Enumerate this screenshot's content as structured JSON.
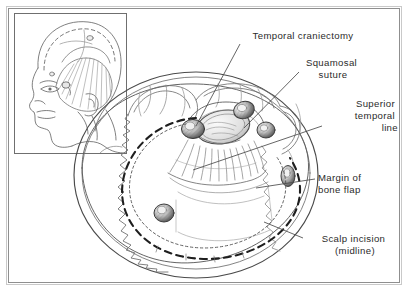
{
  "figure": {
    "title_visible": false,
    "domain": "anatomical-illustration",
    "colors": {
      "background": "#ffffff",
      "frame_border": "#a8a8a8",
      "line_art": "#3a3a3a",
      "line_art_light": "#8d8d8d",
      "text": "#2b2b2b",
      "shading": "#6e6e6e"
    },
    "frame": {
      "outer": {
        "x": 6,
        "y": 6,
        "w": 396,
        "h": 279
      },
      "inner": {
        "x": 8.5,
        "y": 8.5,
        "w": 391,
        "h": 274
      }
    },
    "inset": {
      "name": "lateral-head-orientation-inset",
      "box": {
        "x": 14,
        "y": 13,
        "w": 113,
        "h": 141
      },
      "description": "Lateral view of head showing scalp flap and temporalis muscle reflected, dashed craniotomy outline on calvarium"
    }
  },
  "labels": [
    {
      "id": "temporal-craniectomy",
      "lines": [
        "Temporal craniectomy"
      ],
      "align": "middle",
      "anchor_x": 303,
      "anchor_y": 39,
      "line_height": 12,
      "leader": {
        "x1": 240,
        "y1": 44,
        "x2": 196,
        "y2": 126
      }
    },
    {
      "id": "squamosal-suture",
      "lines": [
        "Squamosal",
        "suture"
      ],
      "align": "middle",
      "anchor_x": 333,
      "anchor_y": 66,
      "line_height": 12,
      "leader": {
        "x1": 299,
        "y1": 72,
        "x2": 244,
        "y2": 128
      }
    },
    {
      "id": "superior-temporal-line",
      "lines": [
        "Superior",
        "temporal",
        "line"
      ],
      "align": "end",
      "anchor_x": 398,
      "anchor_y": 107,
      "line_height": 12,
      "leader": {
        "x1": 322,
        "y1": 126,
        "x2": 193,
        "y2": 170
      }
    },
    {
      "id": "margin-of-bone-flap",
      "lines": [
        "Margin of",
        "bone flap"
      ],
      "align": "start",
      "anchor_x": 318,
      "anchor_y": 181,
      "line_height": 12,
      "leader": {
        "x1": 315,
        "y1": 179,
        "x2": 256,
        "y2": 188
      }
    },
    {
      "id": "scalp-incision-midline",
      "lines": [
        "Scalp incision",
        "(midline)"
      ],
      "align": "middle",
      "anchor_x": 355,
      "anchor_y": 242,
      "line_height": 12,
      "leader": {
        "x1": 303,
        "y1": 238,
        "x2": 264,
        "y2": 222
      }
    }
  ],
  "features": {
    "burr_holes": [
      {
        "id": "burr-hole-anterior-temporal",
        "cx": 193,
        "cy": 128,
        "r": 11
      },
      {
        "id": "burr-hole-frontal",
        "cx": 243,
        "cy": 110,
        "r": 10
      },
      {
        "id": "burr-hole-posterior",
        "cx": 265,
        "cy": 129,
        "r": 8
      },
      {
        "id": "burr-hole-occipital-right",
        "cx": 287,
        "cy": 176,
        "r": 7
      },
      {
        "id": "burr-hole-lower-left",
        "cx": 164,
        "cy": 212,
        "r": 9
      }
    ],
    "craniectomy_defect": {
      "cx": 223,
      "cy": 127,
      "rx": 26,
      "ry": 16,
      "rotation": -12
    },
    "scalp_incision": {
      "style": "bold-dashed",
      "dash": "7,5",
      "width": 2.1,
      "description": "Large dashed arc from temporal region sweeping posteriorly around to midline"
    },
    "bone_flap_margin": {
      "style": "fine-dotted",
      "dash": "2.4,2.6",
      "width": 1,
      "description": "Fine dotted outline just inside the scalp incision delimiting the bone flap"
    },
    "sagittal_suture": {
      "style": "jagged-serrated",
      "description": "Irregular serrated line representing the sagittal/coronal suture running down the left of the vertex"
    },
    "temporalis_muscle": {
      "description": "Radiating striated fibers of reflected temporalis muscle fanning inferiorly from the craniectomy"
    }
  }
}
